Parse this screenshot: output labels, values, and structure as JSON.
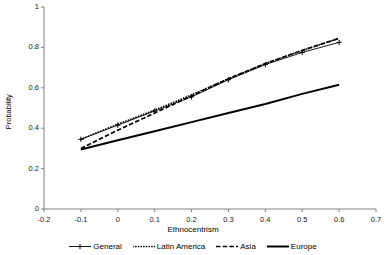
{
  "chart_data": {
    "type": "line",
    "title": "",
    "xlabel": "Ethnocentrism",
    "ylabel": "Probability",
    "xlim": [
      -0.2,
      0.7
    ],
    "ylim": [
      0,
      1
    ],
    "grid": false,
    "legend_position": "bottom",
    "xticks": [
      "-0.2",
      "-0.1",
      "0",
      "0.1",
      "0.2",
      "0.3",
      "0.4",
      "0.5",
      "0.6",
      "0.7"
    ],
    "xtick_values": [
      -0.2,
      -0.1,
      0,
      0.1,
      0.2,
      0.3,
      0.4,
      0.5,
      0.6,
      0.7
    ],
    "yticks": [
      "0",
      "0.2",
      "0.4",
      "0.6",
      "0.8",
      "1"
    ],
    "ytick_values": [
      0,
      0.2,
      0.4,
      0.6,
      0.8,
      1
    ],
    "x": [
      -0.1,
      0,
      0.1,
      0.2,
      0.3,
      0.4,
      0.5,
      0.6
    ],
    "series": [
      {
        "name": "General",
        "style": "solid-marker",
        "marker": "cross",
        "color": "#000000",
        "values": [
          0.345,
          0.415,
          0.485,
          0.555,
          0.64,
          0.715,
          0.775,
          0.825
        ]
      },
      {
        "name": "Latin America",
        "style": "dotted",
        "marker": "none",
        "color": "#000000",
        "values": [
          0.345,
          0.42,
          0.49,
          0.565,
          0.645,
          0.72,
          0.785,
          0.845
        ]
      },
      {
        "name": "Asia",
        "style": "dashed",
        "marker": "none",
        "color": "#000000",
        "values": [
          0.3,
          0.39,
          0.475,
          0.56,
          0.645,
          0.72,
          0.785,
          0.845
        ]
      },
      {
        "name": "Europe",
        "style": "thick-solid",
        "marker": "none",
        "color": "#000000",
        "values": [
          0.295,
          0.34,
          0.385,
          0.43,
          0.475,
          0.52,
          0.57,
          0.615
        ]
      }
    ]
  },
  "axes": {
    "x_axis_name": "x-axis",
    "y_axis_name": "y-axis"
  },
  "legend": {
    "items": [
      {
        "label": "General"
      },
      {
        "label": "Latin America"
      },
      {
        "label": "Asia"
      },
      {
        "label": "Europe"
      }
    ]
  }
}
